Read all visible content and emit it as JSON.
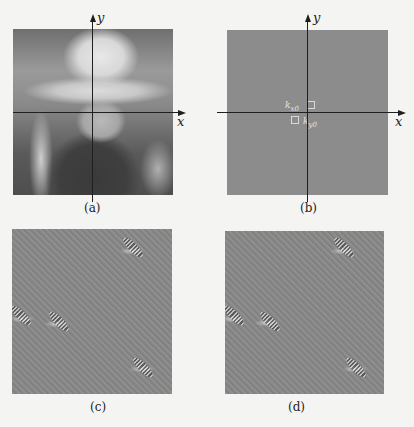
{
  "figure": {
    "panels": [
      {
        "id": "a",
        "caption": "(a)",
        "content": "photograph of child wearing hat",
        "x_axis_label": "x",
        "y_axis_label": "y"
      },
      {
        "id": "b",
        "caption": "(b)",
        "content": "2D Fourier spectrum with two marked peaks",
        "x_axis_label": "x",
        "y_axis_label": "y",
        "markers": [
          {
            "label_main": "k",
            "label_sub": "x0",
            "position": "upper-left of origin"
          },
          {
            "label_main": "k",
            "label_sub": "y0",
            "position": "lower-right of origin"
          }
        ]
      },
      {
        "id": "c",
        "caption": "(c)",
        "content": "filtered image with diagonal fringes"
      },
      {
        "id": "d",
        "caption": "(d)",
        "content": "filtered image with diagonal fringes"
      }
    ],
    "colors": {
      "background": "#f4f4f2",
      "spectrum_gray": "#8c8c8c",
      "fringe_gray": "#898989",
      "axis": "#1f1f1f"
    }
  }
}
